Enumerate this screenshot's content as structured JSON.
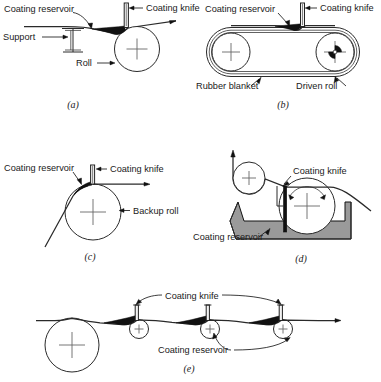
{
  "figure": {
    "panels": [
      {
        "id": "a",
        "caption": "(a)",
        "labels": {
          "coating_reservoir": "Coating reservoir",
          "coating_knife": "Coating knife",
          "support": "Support",
          "roll": "Roll"
        }
      },
      {
        "id": "b",
        "caption": "(b)",
        "labels": {
          "coating_reservoir": "Coating reservoir",
          "coating_knife": "Coating knife",
          "rubber_blanket": "Rubber blanket",
          "driven_roll": "Driven roll"
        }
      },
      {
        "id": "c",
        "caption": "(c)",
        "labels": {
          "coating_reservoir": "Coating reservoir",
          "coating_knife": "Coating knife",
          "backup_roll": "Backup roll"
        }
      },
      {
        "id": "d",
        "caption": "(d)",
        "labels": {
          "coating_knife": "Coating knife",
          "coating_reservoir": "Coating reservoir"
        }
      },
      {
        "id": "e",
        "caption": "(e)",
        "labels": {
          "coating_knife": "Coating knife",
          "coating_reservoir": "Coating reservoir"
        }
      }
    ],
    "colors": {
      "line": "#2a2a2a",
      "fluid": "#111111",
      "pan_fill": "#9a9a9a",
      "background": "#ffffff",
      "text": "#1a1a1a"
    }
  }
}
